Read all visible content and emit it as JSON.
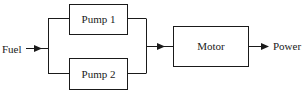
{
  "diagram": {
    "type": "block-diagram",
    "input_label": "Fuel",
    "output_label": "Power",
    "blocks": [
      {
        "id": "pump1",
        "label": "Pump 1"
      },
      {
        "id": "pump2",
        "label": "Pump 2"
      },
      {
        "id": "motor",
        "label": "Motor"
      }
    ],
    "connections": [
      {
        "from": "Fuel",
        "to": "pump1"
      },
      {
        "from": "Fuel",
        "to": "pump2"
      },
      {
        "from": "pump1",
        "to": "motor"
      },
      {
        "from": "pump2",
        "to": "motor"
      },
      {
        "from": "motor",
        "to": "Power"
      }
    ],
    "line_color": "#1a1a1a"
  }
}
